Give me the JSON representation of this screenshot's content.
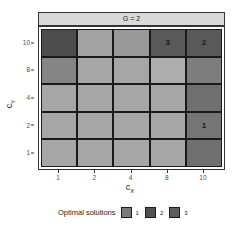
{
  "chart_data": {
    "type": "heatmap",
    "title": "G = 2",
    "xlabel": "c_X",
    "ylabel": "c_Y",
    "x_categories": [
      "1",
      "2",
      "4",
      "8",
      "10"
    ],
    "y_categories": [
      "10",
      "8",
      "4",
      "2",
      "1"
    ],
    "cells": [
      [
        {
          "fill": "#4d4d4d",
          "label": ""
        },
        {
          "fill": "#a3a3a3",
          "label": ""
        },
        {
          "fill": "#999999",
          "label": ""
        },
        {
          "fill": "#595959",
          "label": "3"
        },
        {
          "fill": "#595959",
          "label": "2"
        }
      ],
      [
        {
          "fill": "#858585",
          "label": ""
        },
        {
          "fill": "#a6a6a6",
          "label": ""
        },
        {
          "fill": "#a6a6a6",
          "label": ""
        },
        {
          "fill": "#adadad",
          "label": ""
        },
        {
          "fill": "#7d7d7d",
          "label": ""
        }
      ],
      [
        {
          "fill": "#a6a6a6",
          "label": ""
        },
        {
          "fill": "#a6a6a6",
          "label": ""
        },
        {
          "fill": "#a6a6a6",
          "label": ""
        },
        {
          "fill": "#a6a6a6",
          "label": ""
        },
        {
          "fill": "#707070",
          "label": ""
        }
      ],
      [
        {
          "fill": "#a6a6a6",
          "label": ""
        },
        {
          "fill": "#a6a6a6",
          "label": ""
        },
        {
          "fill": "#a6a6a6",
          "label": ""
        },
        {
          "fill": "#a6a6a6",
          "label": ""
        },
        {
          "fill": "#757575",
          "label": "1"
        }
      ],
      [
        {
          "fill": "#a6a6a6",
          "label": ""
        },
        {
          "fill": "#a6a6a6",
          "label": ""
        },
        {
          "fill": "#a6a6a6",
          "label": ""
        },
        {
          "fill": "#a6a6a6",
          "label": ""
        },
        {
          "fill": "#707070",
          "label": ""
        }
      ]
    ],
    "annotations": [
      {
        "x": "8",
        "y": "10",
        "text": "3"
      },
      {
        "x": "10",
        "y": "10",
        "text": "2"
      },
      {
        "x": "10",
        "y": "2",
        "text": "1"
      }
    ],
    "legend": {
      "title": "Optimal solutions",
      "position": "bottom",
      "entries": [
        {
          "label": "1",
          "color": "#7a7a7a"
        },
        {
          "label": "2",
          "color": "#505050"
        },
        {
          "label": "3",
          "color": "#5e5e5e"
        }
      ]
    },
    "grid": true
  },
  "strip": {
    "label": "G = 2"
  },
  "axes": {
    "x_ticks": [
      "1",
      "2",
      "4",
      "8",
      "10"
    ],
    "y_ticks": [
      "10",
      "8",
      "4",
      "2",
      "1"
    ],
    "xlabel_main": "c",
    "xlabel_sub": "X",
    "ylabel_main": "c",
    "ylabel_sub": "Y"
  },
  "legend": {
    "title": "Optimal solutions",
    "items": [
      {
        "label": "1",
        "color": "#7a7a7a"
      },
      {
        "label": "2",
        "color": "#505050"
      },
      {
        "label": "3",
        "color": "#5e5e5e"
      }
    ]
  }
}
